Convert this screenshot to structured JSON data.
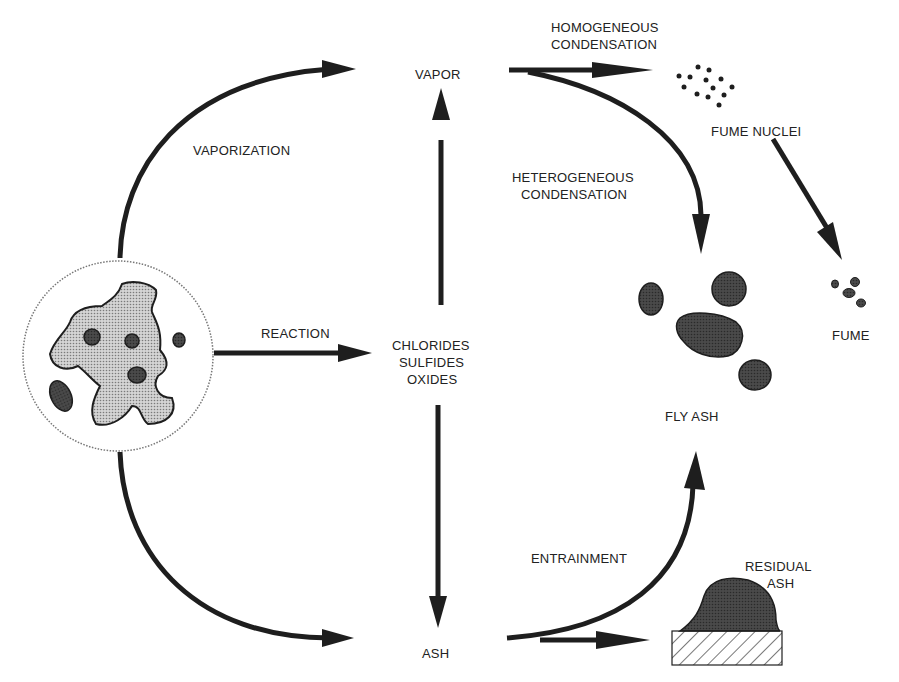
{
  "diagram": {
    "type": "process-flow",
    "colors": {
      "ink": "#1e1e1e",
      "particle_fill": "#555555",
      "mineral_fill": "#bdbdbd",
      "text": "#222222",
      "background": "#ffffff"
    },
    "nodes": {
      "coal_particle": "",
      "vapor": "VAPOR",
      "compounds": [
        "CHLORIDES",
        "SULFIDES",
        "OXIDES"
      ],
      "ash": "ASH",
      "fume_nuclei": "FUME NUCLEI",
      "fume": "FUME",
      "fly_ash": "FLY ASH",
      "residual_ash": [
        "RESIDUAL",
        "ASH"
      ]
    },
    "edges": {
      "vaporization": "VAPORIZATION",
      "reaction": "REACTION",
      "homogeneous_condensation": [
        "HOMOGENEOUS",
        "CONDENSATION"
      ],
      "heterogeneous_condensation": [
        "HETEROGENEOUS",
        "CONDENSATION"
      ],
      "entrainment": "ENTRAINMENT"
    }
  }
}
